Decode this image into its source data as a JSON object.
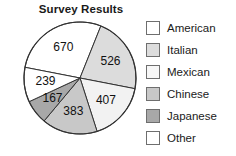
{
  "chart_data": {
    "type": "pie",
    "title": "Survey Results",
    "xlabel": "",
    "ylabel": "",
    "grid": false,
    "legend_position": "right",
    "total": 2392,
    "categories": [
      "American",
      "Italian",
      "Mexican",
      "Chinese",
      "Japanese",
      "Other"
    ],
    "values": [
      670,
      526,
      407,
      383,
      167,
      239
    ],
    "labels": [
      "670",
      "526",
      "407",
      "383",
      "167",
      "239"
    ],
    "colors": [
      "#ffffff",
      "#dcdcdc",
      "#f2f2f2",
      "#c8c8c8",
      "#a8a8a8",
      "#ffffff"
    ],
    "slices": [
      {
        "name": "American",
        "value": 670,
        "label": "670",
        "color": "#ffffff"
      },
      {
        "name": "Italian",
        "value": 526,
        "label": "526",
        "color": "#dcdcdc"
      },
      {
        "name": "Mexican",
        "value": 407,
        "label": "407",
        "color": "#f2f2f2"
      },
      {
        "name": "Chinese",
        "value": 383,
        "label": "383",
        "color": "#c8c8c8"
      },
      {
        "name": "Japanese",
        "value": 167,
        "label": "167",
        "color": "#a8a8a8"
      },
      {
        "name": "Other",
        "value": 239,
        "label": "239",
        "color": "#ffffff"
      }
    ]
  },
  "legend": {
    "items": [
      {
        "label": "American",
        "color": "#ffffff"
      },
      {
        "label": "Italian",
        "color": "#dcdcdc"
      },
      {
        "label": "Mexican",
        "color": "#f7f7f7"
      },
      {
        "label": "Chinese",
        "color": "#c8c8c8"
      },
      {
        "label": "Japanese",
        "color": "#a8a8a8"
      },
      {
        "label": "Other",
        "color": "#ffffff"
      }
    ]
  },
  "style": {
    "stroke": "#333333",
    "text_color": "#111111"
  }
}
